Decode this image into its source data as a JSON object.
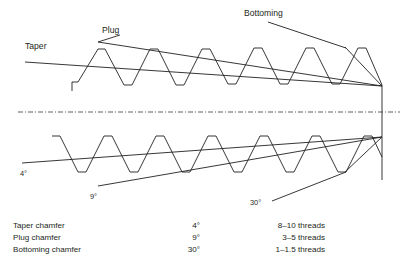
{
  "figure": {
    "title_labels": {
      "taper": "Taper",
      "plug": "Plug",
      "bottoming": "Bottoming"
    },
    "angle_callouts": {
      "taper_angle": "4°",
      "plug_angle": "9°",
      "bottoming_angle": "30°"
    },
    "colors": {
      "line": "#231f20",
      "centerline": "#231f20",
      "background": "#ffffff",
      "text": "#231f20"
    }
  },
  "legend": {
    "rows": [
      {
        "name": "Taper chamfer",
        "angle": "4°",
        "threads": "8–10 threads"
      },
      {
        "name": "Plug chamfer",
        "angle": "9°",
        "threads": "3–5 threads"
      },
      {
        "name": "Bottoming chamfer",
        "angle": "30°",
        "threads": "1–1.5 threads"
      }
    ]
  }
}
